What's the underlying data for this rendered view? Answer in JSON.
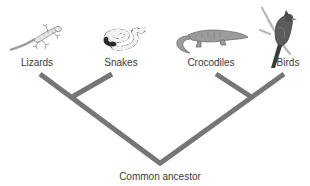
{
  "diagram": {
    "type": "phylogenetic-tree",
    "branch_color": "#767676",
    "taxa": [
      {
        "label": "Lizards",
        "icon": "lizard-illustration"
      },
      {
        "label": "Snakes",
        "icon": "snake-illustration"
      },
      {
        "label": "Crocodiles",
        "icon": "crocodile-illustration"
      },
      {
        "label": "Birds",
        "icon": "bird-illustration"
      }
    ],
    "root": {
      "label": "Common ancestor"
    },
    "clades": [
      {
        "members": [
          "Lizards",
          "Snakes"
        ]
      },
      {
        "members": [
          "Crocodiles",
          "Birds"
        ]
      }
    ]
  }
}
